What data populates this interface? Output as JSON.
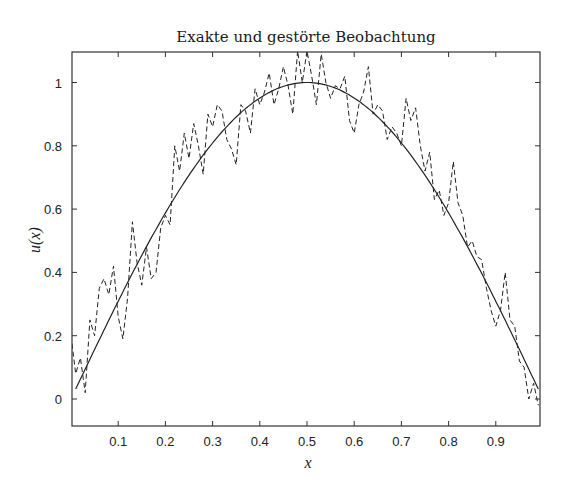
{
  "chart_data": {
    "type": "line",
    "title": "Exakte und gestörte Beobachtung",
    "xlabel": "x",
    "ylabel": "u(x)",
    "xlim": [
      0,
      1
    ],
    "ylim": [
      -0.085,
      1.1
    ],
    "grid": false,
    "legend": null,
    "xticks": [
      0.1,
      0.2,
      0.3,
      0.4,
      0.5,
      0.6,
      0.7,
      0.8,
      0.9
    ],
    "xtick_labels": [
      "0.1",
      "0.2",
      "0.3",
      "0.4",
      "0.5",
      "0.6",
      "0.7",
      "0.8",
      "0.9"
    ],
    "yticks": [
      0,
      0.2,
      0.4,
      0.6,
      0.8,
      1
    ],
    "ytick_labels": [
      "0",
      "0.2",
      "0.4",
      "0.6",
      "0.8",
      "1"
    ],
    "series": [
      {
        "name": "exakt",
        "style": "solid",
        "function": "sin(pi*x)",
        "x": [
          0.01,
          0.05,
          0.1,
          0.15,
          0.2,
          0.25,
          0.3,
          0.35,
          0.4,
          0.45,
          0.5,
          0.55,
          0.6,
          0.65,
          0.7,
          0.75,
          0.8,
          0.85,
          0.9,
          0.95,
          0.99
        ],
        "values": [
          0.03,
          0.16,
          0.31,
          0.45,
          0.59,
          0.71,
          0.81,
          0.89,
          0.95,
          0.99,
          1.0,
          0.99,
          0.95,
          0.89,
          0.81,
          0.71,
          0.59,
          0.45,
          0.31,
          0.16,
          0.03
        ]
      },
      {
        "name": "gestört",
        "style": "dashed",
        "x": [
          0.0,
          0.01,
          0.02,
          0.03,
          0.04,
          0.05,
          0.06,
          0.07,
          0.08,
          0.09,
          0.1,
          0.11,
          0.12,
          0.13,
          0.14,
          0.15,
          0.16,
          0.17,
          0.18,
          0.19,
          0.2,
          0.21,
          0.22,
          0.23,
          0.24,
          0.25,
          0.26,
          0.27,
          0.28,
          0.29,
          0.3,
          0.31,
          0.32,
          0.33,
          0.34,
          0.35,
          0.36,
          0.37,
          0.38,
          0.39,
          0.4,
          0.41,
          0.42,
          0.43,
          0.44,
          0.45,
          0.46,
          0.47,
          0.48,
          0.49,
          0.5,
          0.51,
          0.52,
          0.53,
          0.54,
          0.55,
          0.56,
          0.57,
          0.58,
          0.59,
          0.6,
          0.61,
          0.62,
          0.63,
          0.64,
          0.65,
          0.66,
          0.67,
          0.68,
          0.69,
          0.7,
          0.71,
          0.72,
          0.73,
          0.74,
          0.75,
          0.76,
          0.77,
          0.78,
          0.79,
          0.8,
          0.81,
          0.82,
          0.83,
          0.84,
          0.85,
          0.86,
          0.87,
          0.88,
          0.89,
          0.9,
          0.91,
          0.92,
          0.93,
          0.94,
          0.95,
          0.96,
          0.97,
          0.98,
          0.99
        ],
        "values": [
          0.2,
          0.08,
          0.13,
          0.02,
          0.25,
          0.2,
          0.35,
          0.38,
          0.33,
          0.42,
          0.26,
          0.19,
          0.32,
          0.56,
          0.43,
          0.36,
          0.48,
          0.38,
          0.4,
          0.54,
          0.58,
          0.55,
          0.8,
          0.72,
          0.84,
          0.76,
          0.87,
          0.8,
          0.71,
          0.9,
          0.86,
          0.93,
          0.91,
          0.82,
          0.79,
          0.74,
          0.93,
          0.91,
          0.84,
          0.98,
          0.93,
          0.97,
          1.03,
          0.93,
          0.98,
          1.05,
          0.99,
          0.9,
          1.1,
          1.0,
          1.1,
          1.02,
          0.93,
          1.09,
          1.0,
          0.95,
          0.99,
          0.98,
          1.02,
          0.88,
          0.84,
          0.93,
          0.97,
          1.05,
          0.9,
          0.93,
          0.91,
          0.82,
          0.86,
          0.84,
          0.8,
          0.95,
          0.88,
          0.92,
          0.8,
          0.72,
          0.78,
          0.63,
          0.66,
          0.58,
          0.62,
          0.75,
          0.62,
          0.58,
          0.48,
          0.5,
          0.45,
          0.44,
          0.35,
          0.28,
          0.23,
          0.28,
          0.4,
          0.25,
          0.23,
          0.12,
          0.1,
          0.0,
          0.05,
          -0.02
        ]
      }
    ]
  }
}
